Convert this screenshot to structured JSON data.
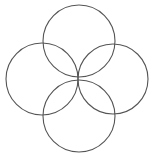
{
  "figure": {
    "background_color": "#ffffff",
    "stroke_color": "#555555",
    "stroke_width": 1.1,
    "fill": "none",
    "width": 155,
    "height": 161
  },
  "chart_data": {
    "type": "diagram",
    "subtype": "geometric-circle-rosette",
    "units": "pixels",
    "coordinate_origin": "top-left",
    "xlim": [
      0,
      155
    ],
    "ylim": [
      0,
      161
    ],
    "grid": false,
    "legend": false,
    "axes_visible": false,
    "common_point": {
      "x": 78,
      "y": 78
    },
    "radius": 36,
    "circle_count": 4,
    "shapes": [
      {
        "name": "top-circle",
        "type": "circle",
        "cx": 79,
        "cy": 41,
        "r": 36,
        "stroke": "#555555",
        "fill": "none"
      },
      {
        "name": "left-circle",
        "type": "circle",
        "cx": 42,
        "cy": 79,
        "r": 36,
        "stroke": "#555555",
        "fill": "none"
      },
      {
        "name": "right-circle",
        "type": "circle",
        "cx": 113,
        "cy": 79,
        "r": 35,
        "stroke": "#555555",
        "fill": "none"
      },
      {
        "name": "bottom-circle",
        "type": "circle",
        "cx": 79,
        "cy": 116,
        "r": 36,
        "stroke": "#555555",
        "fill": "none"
      }
    ],
    "extents": {
      "leftmost_x": 6,
      "rightmost_x": 148,
      "topmost_y": 5,
      "bottommost_y": 152
    }
  }
}
